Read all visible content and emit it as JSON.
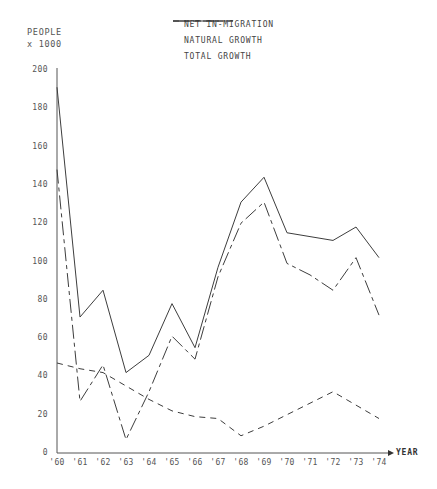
{
  "axis_unit_label": "PEOPLE\nx 1000",
  "legend": {
    "items": [
      {
        "label": "NET IN-MIGRATION",
        "style": "dash-dot",
        "key": "net_in_migration"
      },
      {
        "label": "NATURAL GROWTH",
        "style": "dashed",
        "key": "natural_growth"
      },
      {
        "label": "TOTAL GROWTH",
        "style": "solid",
        "key": "total_growth"
      }
    ]
  },
  "colors": {
    "line": "#3d3d3d",
    "axis": "#555555",
    "text": "#555555",
    "background": "#ffffff"
  },
  "chart_data": {
    "type": "line",
    "title": "",
    "subtitle": "",
    "xlabel": "YEAR",
    "ylabel": "PEOPLE x 1000",
    "categories": [
      "'60",
      "'61",
      "'62",
      "'63",
      "'64",
      "'65",
      "'66",
      "'67",
      "'68",
      "'69",
      "'70",
      "'71",
      "'72",
      "'73",
      "'74"
    ],
    "x": [
      1960,
      1961,
      1962,
      1963,
      1964,
      1965,
      1966,
      1967,
      1968,
      1969,
      1970,
      1971,
      1972,
      1973,
      1974
    ],
    "xlim": [
      1960,
      1974
    ],
    "ylim": [
      0,
      200
    ],
    "yticks": [
      0,
      20,
      40,
      60,
      80,
      100,
      120,
      140,
      160,
      180,
      200
    ],
    "ytick_labels": [
      "0",
      "20",
      "40",
      "60",
      "80",
      "100",
      "120",
      "140",
      "160",
      "180",
      "200"
    ],
    "grid": false,
    "legend_position": "top-right",
    "series": [
      {
        "name": "NET IN-MIGRATION",
        "key": "net_in_migration",
        "style": "dash-dot",
        "values": [
          148,
          27,
          46,
          7,
          32,
          61,
          49,
          92,
          120,
          131,
          99,
          93,
          85,
          102,
          72
        ]
      },
      {
        "name": "NATURAL GROWTH",
        "key": "natural_growth",
        "style": "dashed",
        "values": [
          47,
          44,
          42,
          35,
          28,
          22,
          19,
          18,
          9,
          14,
          20,
          26,
          32,
          25,
          18
        ]
      },
      {
        "name": "TOTAL GROWTH",
        "key": "total_growth",
        "style": "solid",
        "values": [
          191,
          71,
          85,
          42,
          51,
          78,
          55,
          97,
          131,
          144,
          115,
          113,
          111,
          118,
          102
        ]
      }
    ]
  }
}
